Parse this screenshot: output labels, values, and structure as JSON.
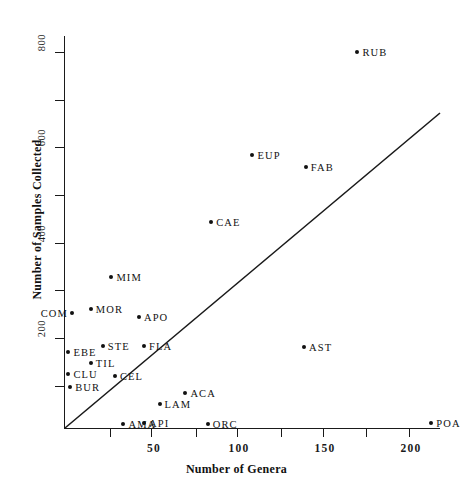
{
  "chart_data": {
    "type": "scatter",
    "title": "",
    "xlabel": "Number of Genera",
    "ylabel": "Number of Samples Collected",
    "xlim": [
      0,
      215
    ],
    "ylim": [
      0,
      830
    ],
    "xticks": [
      50,
      100,
      150,
      200
    ],
    "xticks_minor": [
      25,
      75,
      125,
      175
    ],
    "yticks": [
      200,
      400,
      600,
      800
    ],
    "yticks_minor": [
      100,
      300,
      500,
      700
    ],
    "grid": false,
    "legend": null,
    "annotations": [
      {
        "label": "reference-line",
        "type": "line",
        "x0": 0,
        "y0": 0,
        "x1": 218,
        "y1": 670
      }
    ],
    "points": [
      {
        "label": "RUB",
        "x": 170,
        "y": 800
      },
      {
        "label": "EUP",
        "x": 109,
        "y": 581
      },
      {
        "label": "FAB",
        "x": 140,
        "y": 555
      },
      {
        "label": "CAE",
        "x": 85,
        "y": 438
      },
      {
        "label": "MIM",
        "x": 27,
        "y": 321
      },
      {
        "label": "MOR",
        "x": 15,
        "y": 253
      },
      {
        "label": "APO",
        "x": 43,
        "y": 236
      },
      {
        "label": "COM",
        "x": 4,
        "y": 244
      },
      {
        "label": "EBE",
        "x": 2,
        "y": 162
      },
      {
        "label": "STE",
        "x": 22,
        "y": 174
      },
      {
        "label": "FLA",
        "x": 46,
        "y": 174
      },
      {
        "label": "TIL",
        "x": 15,
        "y": 138
      },
      {
        "label": "CLU",
        "x": 2,
        "y": 115
      },
      {
        "label": "CEL",
        "x": 29,
        "y": 111
      },
      {
        "label": "BUR",
        "x": 3,
        "y": 87
      },
      {
        "label": "AST",
        "x": 139,
        "y": 172
      },
      {
        "label": "ACA",
        "x": 70,
        "y": 74
      },
      {
        "label": "LAM",
        "x": 55,
        "y": 51
      },
      {
        "label": "AMA",
        "x": 34,
        "y": 9
      },
      {
        "label": "API",
        "x": 46,
        "y": 11
      },
      {
        "label": "ORC",
        "x": 83,
        "y": 9
      },
      {
        "label": "POA",
        "x": 213,
        "y": 11
      }
    ]
  },
  "axes": {
    "x_title": "Number of Genera",
    "y_title": "Number of Samples Collected",
    "x_tick_labels": [
      "50",
      "100",
      "150",
      "200"
    ],
    "y_tick_labels": [
      "200",
      "400",
      "600",
      "800"
    ]
  },
  "style": {
    "ink": "#111111",
    "background": "#ffffff"
  }
}
